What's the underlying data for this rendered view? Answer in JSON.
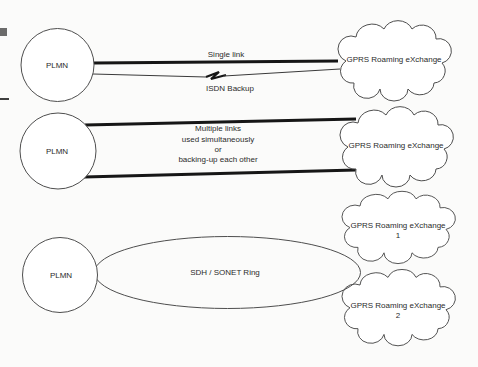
{
  "colors": {
    "background": "#fbfbfa",
    "outline": "#4e4e4e",
    "link": "#161616",
    "text": "#2b2b2b"
  },
  "sections": [
    {
      "id": "single-link-with-isdn-backup",
      "plmn": "PLMN",
      "grx": "GPRS Roaming eXchange",
      "link_label": "Single link",
      "backup_label": "ISDN Backup"
    },
    {
      "id": "multiple-links",
      "plmn": "PLMN",
      "grx": "GPRS Roaming eXchange",
      "lines": [
        "Multiple links",
        "used simultaneously",
        "or",
        "backing-up each other"
      ]
    },
    {
      "id": "sdh-sonet-ring",
      "plmn": "PLMN",
      "ring_label": "SDH / SONET Ring",
      "grx_top": [
        "GPRS Roaming eXchange",
        "1"
      ],
      "grx_bottom": [
        "GPRS Roaming eXchange",
        "2"
      ]
    }
  ]
}
